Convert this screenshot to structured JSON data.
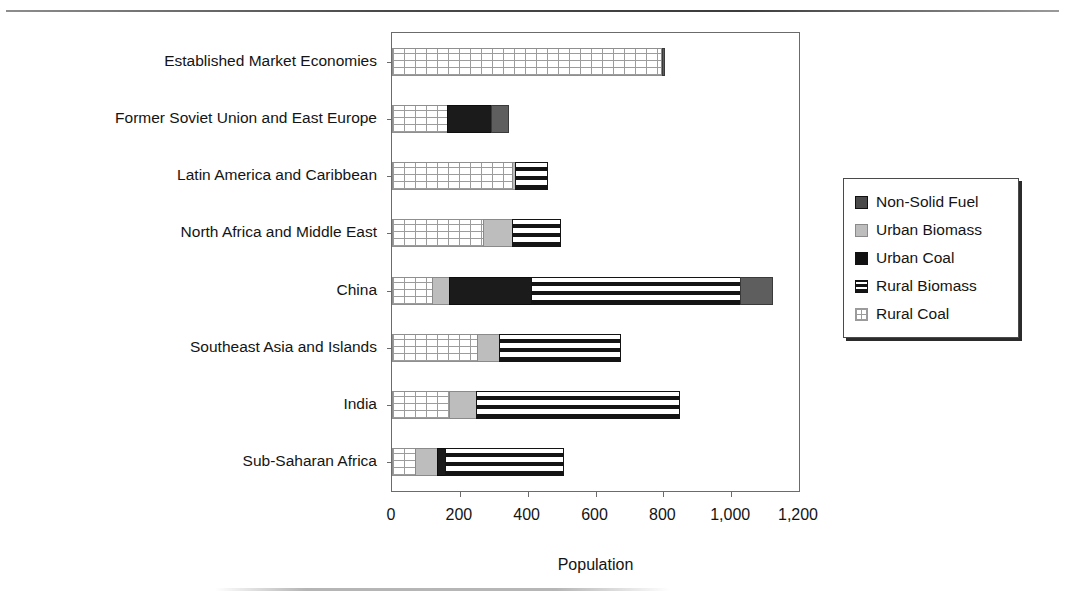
{
  "page": {
    "top_rule": "horizontal-rule",
    "bottom_artifact": "scan-smudge"
  },
  "chart_data": {
    "type": "bar",
    "orientation": "horizontal",
    "stacked": true,
    "title": "",
    "xlabel": "Population",
    "ylabel": "",
    "xlim": [
      0,
      1200
    ],
    "xticks": [
      0,
      200,
      400,
      600,
      800,
      1000,
      1200
    ],
    "xtick_labels": [
      "0",
      "200",
      "400",
      "600",
      "800",
      "1,000",
      "1,200"
    ],
    "grid": false,
    "legend_position": "right",
    "categories": [
      "Established Market Economies",
      "Former Soviet Union and East Europe",
      "Latin America and Caribbean",
      "North Africa and Middle East",
      "China",
      "Southeast Asia and Islands",
      "India",
      "Sub-Saharan Africa"
    ],
    "series": [
      {
        "name": "Rural Coal",
        "key": "rural-coal",
        "color": "#ffffff",
        "pattern": "grid",
        "values": [
          795,
          165,
          358,
          270,
          120,
          255,
          170,
          70
        ]
      },
      {
        "name": "Urban Biomass",
        "key": "urban-biomass",
        "color": "#bdbdbd",
        "pattern": "solid-gray",
        "values": [
          8,
          0,
          12,
          90,
          55,
          65,
          85,
          70
        ]
      },
      {
        "name": "Urban Coal",
        "key": "urban-coal",
        "color": "#1b1b1b",
        "pattern": "solid-black",
        "values": [
          0,
          132,
          0,
          0,
          243,
          0,
          0,
          25
        ]
      },
      {
        "name": "Rural Biomass",
        "key": "rural-biomass",
        "color": "#141414",
        "pattern": "horizontal-stripes",
        "values": [
          0,
          0,
          95,
          145,
          620,
          360,
          601,
          350
        ]
      },
      {
        "name": "Non-Solid Fuel",
        "key": "non-solid",
        "color": "#5e5e5e",
        "pattern": "solid-dark-gray",
        "values": [
          7,
          53,
          0,
          0,
          97,
          0,
          0,
          0
        ]
      }
    ],
    "totals": [
      810,
      350,
      465,
      505,
      1135,
      680,
      856,
      515
    ]
  },
  "legend": {
    "items": [
      {
        "label": "Non-Solid Fuel",
        "key": "non-solid"
      },
      {
        "label": "Urban Biomass",
        "key": "urban-biomass"
      },
      {
        "label": "Urban Coal",
        "key": "urban-coal"
      },
      {
        "label": "Rural Biomass",
        "key": "rural-biomass"
      },
      {
        "label": "Rural Coal",
        "key": "rural-coal"
      }
    ]
  }
}
